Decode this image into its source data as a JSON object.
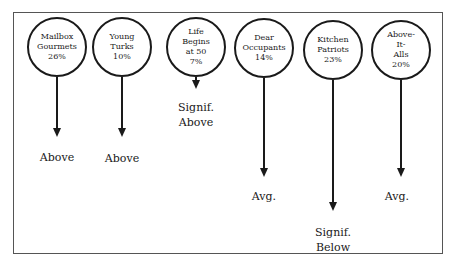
{
  "diagram": {
    "segments": [
      {
        "name": "Mailbox Gourmets",
        "lines": [
          "Mailbox",
          "Gourmets",
          "26%"
        ],
        "share": "26%",
        "outcome_lines": [
          "Above"
        ],
        "outcome": "Above"
      },
      {
        "name": "Young Turks",
        "lines": [
          "Young",
          "Turks",
          "10%"
        ],
        "share": "10%",
        "outcome_lines": [
          "Above"
        ],
        "outcome": "Above"
      },
      {
        "name": "Life Begins at 50",
        "lines": [
          "Life",
          "Begins",
          "at 50",
          "7%"
        ],
        "share": "7%",
        "outcome_lines": [
          "Signif.",
          "Above"
        ],
        "outcome": "Signif. Above"
      },
      {
        "name": "Dear Occupants",
        "lines": [
          "Dear",
          "Occupants",
          "14%"
        ],
        "share": "14%",
        "outcome_lines": [
          "Avg."
        ],
        "outcome": "Avg."
      },
      {
        "name": "Kitchen Patriots",
        "lines": [
          "Kitchen",
          "Patriots",
          "23%"
        ],
        "share": "23%",
        "outcome_lines": [
          "Signif.",
          "Below"
        ],
        "outcome": "Signif. Below"
      },
      {
        "name": "Above-It-Alls",
        "lines": [
          "Above-",
          "It-",
          "Alls",
          "20%"
        ],
        "share": "20%",
        "outcome_lines": [
          "Avg."
        ],
        "outcome": "Avg."
      }
    ]
  }
}
